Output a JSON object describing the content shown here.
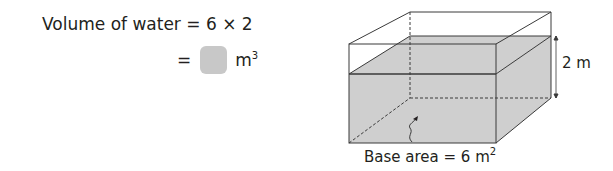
{
  "equation": {
    "line1": {
      "lhs": "Volume of water",
      "op": "=",
      "expr": "6 × 2"
    },
    "line2": {
      "op": "=",
      "answer": "",
      "unit": "m",
      "unit_exp": "3"
    }
  },
  "diagram": {
    "type": "cuboid-tank-with-water",
    "height_label": "2 m",
    "base_label": "Base area = 6 m",
    "base_exp": "2",
    "colors": {
      "water": "#cfcfcf",
      "line": "#3a3a3a",
      "answer_box": "#c8c8c8"
    }
  }
}
